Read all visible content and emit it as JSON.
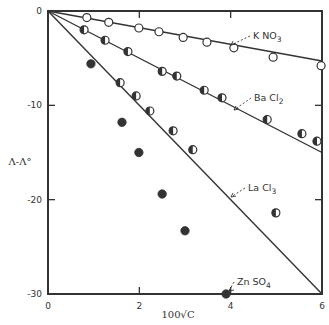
{
  "chart_data": {
    "type": "scatter",
    "title": "",
    "xlabel": "100√C",
    "ylabel": "Λ-Λ°",
    "xlim": [
      0,
      6
    ],
    "ylim": [
      -30,
      0
    ],
    "xticks": [
      0,
      2,
      4,
      6
    ],
    "xtick_labels": [
      "0",
      "2",
      "4",
      "6"
    ],
    "yticks": [
      0,
      -10,
      -20,
      -30
    ],
    "ytick_labels": [
      "0",
      "-10",
      "-20",
      "-30"
    ],
    "grid": false,
    "legend": "inline annotations",
    "series": [
      {
        "name": "KNO3",
        "label_text": "K NO",
        "label_sub": "3",
        "marker": "open-circle",
        "limiting_line": [
          [
            0,
            0
          ],
          [
            6,
            -5.3
          ]
        ],
        "points": [
          [
            0.85,
            -0.7
          ],
          [
            1.33,
            -1.2
          ],
          [
            1.99,
            -1.8
          ],
          [
            2.43,
            -2.2
          ],
          [
            2.96,
            -2.8
          ],
          [
            3.48,
            -3.3
          ],
          [
            4.07,
            -3.9
          ],
          [
            4.93,
            -4.9
          ],
          [
            5.98,
            -5.8
          ]
        ]
      },
      {
        "name": "BaCl2",
        "label_text": "Ba Cl",
        "label_sub": "2",
        "marker": "half-filled-circle",
        "limiting_line": [
          [
            0,
            0
          ],
          [
            6,
            -15
          ]
        ],
        "points": [
          [
            0.79,
            -2.0
          ],
          [
            1.25,
            -3.1
          ],
          [
            1.75,
            -4.3
          ],
          [
            2.5,
            -6.4
          ],
          [
            2.82,
            -6.9
          ],
          [
            3.42,
            -8.4
          ],
          [
            3.81,
            -9.2
          ],
          [
            4.8,
            -11.5
          ],
          [
            5.56,
            -13.0
          ],
          [
            5.89,
            -13.8
          ]
        ]
      },
      {
        "name": "LaCl3",
        "label_text": "La Cl",
        "label_sub": "3",
        "marker": "half-filled-circle",
        "limiting_line": [
          [
            0,
            0
          ],
          [
            6,
            -30
          ]
        ],
        "points": [
          [
            1.58,
            -7.6
          ],
          [
            1.93,
            -9.0
          ],
          [
            2.23,
            -10.6
          ],
          [
            2.74,
            -12.7
          ],
          [
            3.17,
            -14.7
          ],
          [
            4.99,
            -21.4
          ]
        ]
      },
      {
        "name": "ZnSO4",
        "label_text": "Zn SO",
        "label_sub": "4",
        "marker": "filled-circle",
        "limiting_line": null,
        "points": [
          [
            0.94,
            -5.6
          ],
          [
            1.62,
            -11.8
          ],
          [
            1.99,
            -15.0
          ],
          [
            2.5,
            -19.4
          ],
          [
            3.0,
            -23.3
          ],
          [
            3.9,
            -30.0
          ]
        ]
      }
    ],
    "annotations": [
      {
        "series": "KNO3",
        "text_xy": [
          253,
          39
        ],
        "arrow_to": [
          231,
          45
        ]
      },
      {
        "series": "BaCl2",
        "text_xy": [
          254,
          101
        ],
        "arrow_to": [
          234,
          110
        ]
      },
      {
        "series": "LaCl3",
        "text_xy": [
          248,
          191
        ],
        "arrow_to": [
          231,
          197
        ]
      },
      {
        "series": "ZnSO4",
        "text_xy": [
          237,
          285
        ],
        "arrow_to": [
          229,
          291
        ]
      }
    ]
  },
  "colors": {
    "ink": "#333333",
    "background": "#ffffff"
  }
}
